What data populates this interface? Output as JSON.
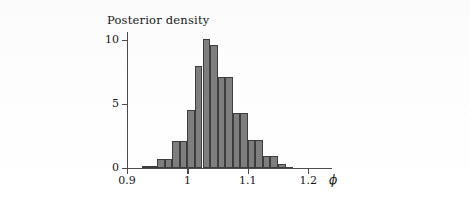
{
  "figure": {
    "background_color": "#fcfcfc",
    "axis_color": "#4b4b4b",
    "bar_fill_color": "#7e7e7e",
    "bar_edge_color": "#3d3d3d"
  },
  "chart_data": {
    "type": "bar",
    "title": "Posterior density",
    "subtitle": "",
    "xlabel": "ϕ",
    "ylabel": "",
    "xlim": [
      0.9,
      1.2125
    ],
    "ylim": [
      0,
      10.6
    ],
    "grid": false,
    "legend": null,
    "x_ticks": [
      0.9,
      1.0,
      1.1,
      1.2
    ],
    "x_tick_labels": [
      "0.9",
      "1",
      "1.1",
      "1.2"
    ],
    "y_ticks": [
      0,
      5,
      10
    ],
    "y_tick_labels": [
      "0",
      "5",
      "10"
    ],
    "bin_width": 0.0125,
    "bins": [
      {
        "left": 0.925,
        "right": 0.9375,
        "value": 0.15
      },
      {
        "left": 0.9375,
        "right": 0.95,
        "value": 0.15
      },
      {
        "left": 0.95,
        "right": 0.9625,
        "value": 0.65
      },
      {
        "left": 0.9625,
        "right": 0.975,
        "value": 0.65
      },
      {
        "left": 0.975,
        "right": 0.9875,
        "value": 2.1
      },
      {
        "left": 0.9875,
        "right": 1.0,
        "value": 2.1
      },
      {
        "left": 1.0,
        "right": 1.0125,
        "value": 4.5
      },
      {
        "left": 1.0125,
        "right": 1.025,
        "value": 8.0
      },
      {
        "left": 1.025,
        "right": 1.0375,
        "value": 10.1
      },
      {
        "left": 1.0375,
        "right": 1.05,
        "value": 9.6
      },
      {
        "left": 1.05,
        "right": 1.0625,
        "value": 7.1
      },
      {
        "left": 1.0625,
        "right": 1.075,
        "value": 7.1
      },
      {
        "left": 1.075,
        "right": 1.0875,
        "value": 4.3
      },
      {
        "left": 1.0875,
        "right": 1.1,
        "value": 4.3
      },
      {
        "left": 1.1,
        "right": 1.1125,
        "value": 2.2
      },
      {
        "left": 1.1125,
        "right": 1.125,
        "value": 2.2
      },
      {
        "left": 1.125,
        "right": 1.1375,
        "value": 0.9
      },
      {
        "left": 1.1375,
        "right": 1.15,
        "value": 0.9
      },
      {
        "left": 1.15,
        "right": 1.1625,
        "value": 0.3
      },
      {
        "left": 1.1625,
        "right": 1.175,
        "value": 0.08
      }
    ]
  }
}
